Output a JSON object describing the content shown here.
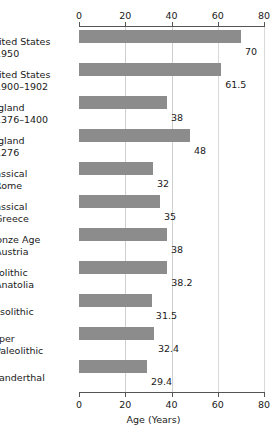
{
  "chart_data": {
    "type": "bar",
    "orientation": "horizontal",
    "title": "",
    "xlabel": "Age (Years)",
    "ylabel": "",
    "xlim": [
      0,
      80
    ],
    "xticks": [
      0,
      20,
      40,
      60,
      80
    ],
    "xtick_labels": [
      "0",
      "20",
      "40",
      "60",
      "80"
    ],
    "grid": true,
    "grid_axis": "x",
    "legend": false,
    "axis_top": true,
    "axis_bottom": true,
    "bar_color": "#8c8c8c",
    "categories": [
      "United States 1950",
      "United States 1900–1902",
      "England 1376–1400",
      "England 1276",
      "Classical Rome",
      "Classical Greece",
      "Bronze Age Austria",
      "Neolithic Anatolia",
      "Mesolithic",
      "Upper Paleolithic",
      "Neanderthal"
    ],
    "values": [
      70,
      61.5,
      38,
      48,
      32,
      35,
      38,
      38.2,
      31.5,
      32.4,
      29.4
    ],
    "value_labels": [
      "70",
      "61.5",
      "38",
      "48",
      "32",
      "35",
      "38",
      "38.2",
      "31.5",
      "32.4",
      "29.4"
    ]
  },
  "rows": [
    {
      "line1": "United States",
      "line2": "1950",
      "value": 70,
      "value_label": "70"
    },
    {
      "line1": "United States",
      "line2": "1900–1902",
      "value": 61.5,
      "value_label": "61.5"
    },
    {
      "line1": "England",
      "line2": "1376–1400",
      "value": 38,
      "value_label": "38"
    },
    {
      "line1": "England",
      "line2": "1276",
      "value": 48,
      "value_label": "48"
    },
    {
      "line1": "Classical",
      "line2": "Rome",
      "value": 32,
      "value_label": "32"
    },
    {
      "line1": "Classical",
      "line2": "Greece",
      "value": 35,
      "value_label": "35"
    },
    {
      "line1": "Bronze Age",
      "line2": "Austria",
      "value": 38,
      "value_label": "38"
    },
    {
      "line1": "Neolithic",
      "line2": "Anatolia",
      "value": 38.2,
      "value_label": "38.2"
    },
    {
      "line1": "Mesolithic",
      "line2": "",
      "value": 31.5,
      "value_label": "31.5"
    },
    {
      "line1": "Upper",
      "line2": "Paleolithic",
      "value": 32.4,
      "value_label": "32.4"
    },
    {
      "line1": "Neanderthal",
      "line2": "",
      "value": 29.4,
      "value_label": "29.4"
    }
  ],
  "axis": {
    "xlabel": "Age (Years)",
    "ticks": [
      "0",
      "20",
      "40",
      "60",
      "80"
    ]
  }
}
